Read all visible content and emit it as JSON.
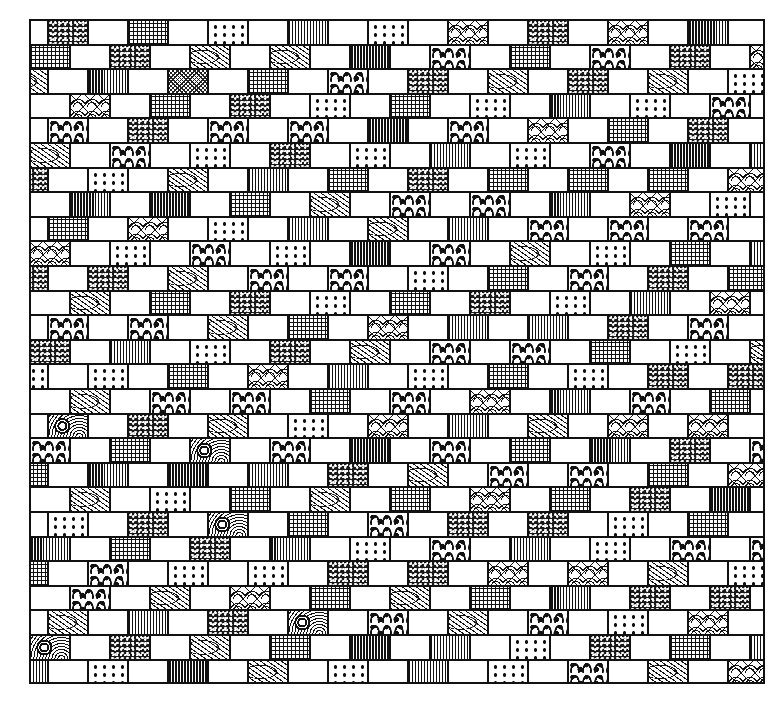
{
  "illustration": {
    "title": "Patterned brick wall",
    "grid": {
      "left": 29,
      "top": 19,
      "width": 736,
      "height": 665,
      "row_height": 24.6,
      "brick_width": 40
    },
    "legend": {
      "W": "plain-white",
      "S": "speckled",
      "G": "grid-check",
      "C": "fine-crosshatch",
      "D": "polka-dots",
      "V": "vertical-stripes",
      "L": "leaf",
      "B": "blob-spots",
      "F": "floral-arc",
      "M": "medallion"
    },
    "rows": [
      {
        "offset": -22,
        "bricks": [
          "W",
          "S",
          "W",
          "G",
          "W",
          "D",
          "W",
          "V",
          "W",
          "D",
          "W",
          "F",
          "W",
          "S",
          "W",
          "F",
          "W",
          "V",
          "W"
        ]
      },
      {
        "offset": 0,
        "bricks": [
          "G",
          "W",
          "S",
          "W",
          "L",
          "W",
          "L",
          "W",
          "V",
          "W",
          "B",
          "W",
          "G",
          "W",
          "B",
          "W",
          "S",
          "W",
          "F"
        ]
      },
      {
        "offset": -22,
        "bricks": [
          "L",
          "W",
          "V",
          "W",
          "C",
          "W",
          "G",
          "W",
          "B",
          "W",
          "S",
          "W",
          "L",
          "W",
          "S",
          "W",
          "L",
          "W",
          "D"
        ]
      },
      {
        "offset": 0,
        "bricks": [
          "W",
          "F",
          "W",
          "G",
          "W",
          "S",
          "W",
          "D",
          "W",
          "G",
          "W",
          "D",
          "W",
          "V",
          "W",
          "D",
          "W",
          "B",
          "W"
        ]
      },
      {
        "offset": -22,
        "bricks": [
          "W",
          "B",
          "W",
          "S",
          "W",
          "B",
          "W",
          "B",
          "W",
          "V",
          "W",
          "B",
          "W",
          "F",
          "W",
          "G",
          "W",
          "S",
          "W"
        ]
      },
      {
        "offset": 0,
        "bricks": [
          "L",
          "W",
          "B",
          "W",
          "D",
          "W",
          "S",
          "W",
          "D",
          "W",
          "V",
          "W",
          "D",
          "W",
          "B",
          "W",
          "V",
          "W",
          "V"
        ]
      },
      {
        "offset": -22,
        "bricks": [
          "S",
          "W",
          "D",
          "W",
          "L",
          "W",
          "V",
          "W",
          "G",
          "W",
          "S",
          "W",
          "G",
          "W",
          "G",
          "W",
          "G",
          "W",
          "F"
        ]
      },
      {
        "offset": 0,
        "bricks": [
          "W",
          "V",
          "W",
          "V",
          "W",
          "G",
          "W",
          "L",
          "W",
          "B",
          "W",
          "B",
          "W",
          "V",
          "W",
          "F",
          "W",
          "D",
          "W"
        ]
      },
      {
        "offset": -22,
        "bricks": [
          "W",
          "G",
          "W",
          "F",
          "W",
          "D",
          "W",
          "V",
          "W",
          "L",
          "W",
          "V",
          "W",
          "B",
          "W",
          "B",
          "W",
          "B",
          "W"
        ]
      },
      {
        "offset": 0,
        "bricks": [
          "F",
          "W",
          "D",
          "W",
          "B",
          "W",
          "D",
          "W",
          "V",
          "W",
          "B",
          "W",
          "L",
          "W",
          "D",
          "W",
          "G",
          "W",
          "V"
        ]
      },
      {
        "offset": -22,
        "bricks": [
          "S",
          "W",
          "S",
          "W",
          "L",
          "W",
          "B",
          "W",
          "B",
          "W",
          "D",
          "W",
          "G",
          "W",
          "B",
          "W",
          "S",
          "W",
          "G"
        ]
      },
      {
        "offset": 0,
        "bricks": [
          "W",
          "L",
          "W",
          "G",
          "W",
          "S",
          "W",
          "D",
          "W",
          "G",
          "W",
          "S",
          "W",
          "D",
          "W",
          "V",
          "W",
          "F",
          "W"
        ]
      },
      {
        "offset": -22,
        "bricks": [
          "W",
          "B",
          "W",
          "B",
          "W",
          "L",
          "W",
          "G",
          "W",
          "F",
          "W",
          "V",
          "W",
          "V",
          "W",
          "S",
          "W",
          "B",
          "W"
        ]
      },
      {
        "offset": 0,
        "bricks": [
          "S",
          "W",
          "V",
          "W",
          "D",
          "W",
          "S",
          "W",
          "L",
          "W",
          "B",
          "W",
          "B",
          "W",
          "G",
          "W",
          "D",
          "W",
          "L"
        ]
      },
      {
        "offset": -22,
        "bricks": [
          "D",
          "W",
          "D",
          "W",
          "G",
          "W",
          "F",
          "W",
          "V",
          "W",
          "D",
          "W",
          "G",
          "W",
          "D",
          "W",
          "S",
          "W",
          "S"
        ]
      },
      {
        "offset": 0,
        "bricks": [
          "W",
          "L",
          "W",
          "B",
          "W",
          "B",
          "W",
          "G",
          "W",
          "B",
          "W",
          "F",
          "W",
          "V",
          "W",
          "B",
          "W",
          "G",
          "W"
        ]
      },
      {
        "offset": -22,
        "bricks": [
          "W",
          "M",
          "W",
          "S",
          "W",
          "L",
          "W",
          "D",
          "W",
          "F",
          "W",
          "V",
          "W",
          "L",
          "W",
          "F",
          "W",
          "F",
          "W"
        ]
      },
      {
        "offset": 0,
        "bricks": [
          "B",
          "W",
          "G",
          "W",
          "M",
          "W",
          "B",
          "W",
          "V",
          "W",
          "B",
          "W",
          "G",
          "W",
          "V",
          "W",
          "S",
          "W",
          "B"
        ]
      },
      {
        "offset": -22,
        "bricks": [
          "G",
          "W",
          "V",
          "W",
          "V",
          "W",
          "V",
          "W",
          "S",
          "W",
          "L",
          "W",
          "B",
          "W",
          "B",
          "W",
          "G",
          "W",
          "F"
        ]
      },
      {
        "offset": 0,
        "bricks": [
          "W",
          "L",
          "W",
          "D",
          "W",
          "G",
          "W",
          "L",
          "W",
          "G",
          "W",
          "F",
          "W",
          "G",
          "W",
          "S",
          "W",
          "V",
          "W"
        ]
      },
      {
        "offset": -22,
        "bricks": [
          "W",
          "D",
          "W",
          "S",
          "W",
          "M",
          "W",
          "G",
          "W",
          "B",
          "W",
          "S",
          "W",
          "S",
          "W",
          "D",
          "W",
          "G",
          "W"
        ]
      },
      {
        "offset": 0,
        "bricks": [
          "V",
          "W",
          "G",
          "W",
          "S",
          "W",
          "V",
          "W",
          "D",
          "W",
          "B",
          "W",
          "V",
          "W",
          "D",
          "W",
          "B",
          "W",
          "B"
        ]
      },
      {
        "offset": -22,
        "bricks": [
          "G",
          "W",
          "B",
          "W",
          "D",
          "W",
          "D",
          "W",
          "S",
          "W",
          "S",
          "W",
          "F",
          "W",
          "F",
          "W",
          "L",
          "W",
          "D"
        ]
      },
      {
        "offset": 0,
        "bricks": [
          "W",
          "B",
          "W",
          "L",
          "W",
          "F",
          "W",
          "G",
          "W",
          "L",
          "W",
          "G",
          "W",
          "V",
          "W",
          "S",
          "W",
          "S",
          "W"
        ]
      },
      {
        "offset": -22,
        "bricks": [
          "W",
          "L",
          "W",
          "V",
          "W",
          "S",
          "W",
          "M",
          "W",
          "B",
          "W",
          "L",
          "W",
          "B",
          "W",
          "D",
          "W",
          "F",
          "W"
        ]
      },
      {
        "offset": 0,
        "bricks": [
          "M",
          "W",
          "S",
          "W",
          "L",
          "W",
          "G",
          "W",
          "V",
          "W",
          "V",
          "W",
          "D",
          "W",
          "S",
          "W",
          "G",
          "W",
          "V"
        ]
      },
      {
        "offset": -22,
        "bricks": [
          "V",
          "W",
          "D",
          "W",
          "V",
          "W",
          "L",
          "W",
          "D",
          "W",
          "V",
          "W",
          "D",
          "W",
          "B",
          "W",
          "L",
          "W",
          "F"
        ]
      }
    ]
  }
}
